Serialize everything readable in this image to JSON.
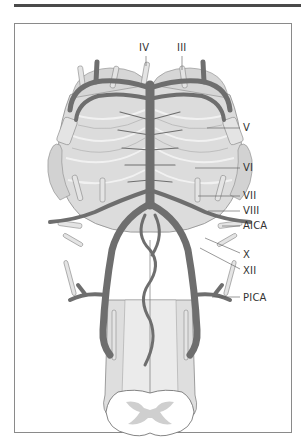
{
  "figure": {
    "colors": {
      "artery": "#6e6e6e",
      "artery_dark": "#555555",
      "brainstem": "#dcdcdc",
      "pons_stripes": "#f2f2f2",
      "nerve": "#cfcfcf",
      "outline": "#8a8a8a",
      "top_rule": "#4a4a4a",
      "label_text": "#333333"
    },
    "labels": {
      "IV": "IV",
      "III": "III",
      "V": "V",
      "VI": "VI",
      "VII": "VII",
      "VIII": "VIII",
      "AICA": "AICA",
      "X": "X",
      "XII": "XII",
      "PICA": "PICA"
    }
  }
}
